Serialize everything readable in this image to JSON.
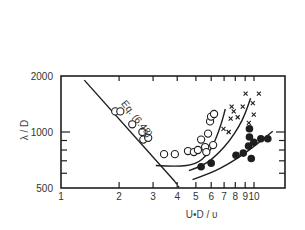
{
  "chart_data": {
    "type": "scatter",
    "title": "",
    "xlabel": "U•D / υ",
    "ylabel": "λ / D",
    "xscale": "log",
    "yscale": "log",
    "xlim": [
      1,
      15
    ],
    "ylim": [
      500,
      2000
    ],
    "grid": false,
    "legend": null,
    "x_ticks": [
      {
        "value": 1,
        "label": "1"
      },
      {
        "value": 2,
        "label": "2"
      },
      {
        "value": 3,
        "label": "3"
      },
      {
        "value": 4,
        "label": "4"
      },
      {
        "value": 5,
        "label": "5"
      },
      {
        "value": 6,
        "label": "6"
      },
      {
        "value": 7,
        "label": "7"
      },
      {
        "value": 8,
        "label": "8"
      },
      {
        "value": 9,
        "label": "9"
      },
      {
        "value": 10,
        "label": "10"
      }
    ],
    "y_ticks": [
      {
        "value": 500,
        "label": "500"
      },
      {
        "value": 1000,
        "label": "1000"
      },
      {
        "value": 2000,
        "label": "2000"
      }
    ],
    "y_minor_ticks": [
      600,
      700,
      800,
      900
    ],
    "annotations": [
      {
        "text": "Eq. (6.48)",
        "x": 2.4,
        "y": 1150,
        "rotation": 52
      }
    ],
    "lines": [
      {
        "name": "Eq. (6.48)",
        "style": "solid",
        "points": [
          [
            1.32,
            1900
          ],
          [
            3.9,
            540
          ]
        ]
      },
      {
        "name": "Eq. (6.48) extension",
        "style": "dashed",
        "points": [
          [
            3.9,
            540
          ],
          [
            4.09,
            505
          ]
        ]
      },
      {
        "name": "open-circle trend",
        "style": "solid",
        "points": [
          [
            3.1,
            660
          ],
          [
            4.0,
            650
          ],
          [
            5.0,
            670
          ],
          [
            5.8,
            760
          ],
          [
            6.3,
            900
          ],
          [
            6.8,
            1120
          ],
          [
            7.1,
            1330
          ]
        ]
      },
      {
        "name": "cross trend",
        "style": "solid",
        "points": [
          [
            4.6,
            620
          ],
          [
            5.5,
            660
          ],
          [
            6.5,
            760
          ],
          [
            7.5,
            900
          ],
          [
            8.4,
            1080
          ],
          [
            9.0,
            1250
          ],
          [
            9.6,
            1520
          ]
        ]
      },
      {
        "name": "filled-circle trend",
        "style": "solid",
        "points": [
          [
            4.8,
            555
          ],
          [
            6.0,
            600
          ],
          [
            7.5,
            680
          ],
          [
            9.0,
            770
          ],
          [
            10.5,
            870
          ],
          [
            12.5,
            1010
          ]
        ]
      }
    ],
    "series": [
      {
        "name": "open circles",
        "marker": "open-circle",
        "x": [
          1.91,
          2.03,
          2.34,
          2.64,
          2.67,
          2.83,
          3.42,
          3.89,
          4.55,
          4.88,
          5.12,
          5.32,
          5.58,
          5.78,
          5.92,
          5.99,
          6.21,
          6.14,
          5.66
        ],
        "y": [
          1290,
          1290,
          1100,
          1000,
          910,
          930,
          760,
          760,
          790,
          780,
          800,
          910,
          830,
          980,
          1140,
          1210,
          1250,
          850,
          780
        ]
      },
      {
        "name": "crosses",
        "marker": "cross",
        "x": [
          6.95,
          7.39,
          7.57,
          7.66,
          7.85,
          8.23,
          8.74,
          9.05,
          9.86,
          9.97,
          10.6,
          9.4
        ],
        "y": [
          1040,
          1000,
          1180,
          1370,
          1290,
          1200,
          1370,
          1610,
          1430,
          1240,
          1610,
          1120
        ]
      },
      {
        "name": "filled circles",
        "marker": "filled-circle",
        "x": [
          5.32,
          6.0,
          8.07,
          8.8,
          9.37,
          9.47,
          9.98,
          9.68,
          10.85,
          11.79,
          9.47
        ],
        "y": [
          650,
          680,
          750,
          770,
          840,
          940,
          880,
          720,
          920,
          920,
          1040
        ]
      }
    ]
  },
  "plot": {
    "frame": {
      "left": 61,
      "top": 76,
      "right": 285,
      "bottom": 188
    },
    "px_per_decade_x": 193,
    "px_per_decade_y": 186,
    "ink_color": "#1e1e1e"
  }
}
